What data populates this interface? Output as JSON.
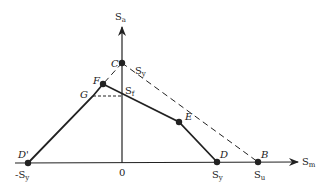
{
  "diagram": {
    "type": "modified goodman / fatigue diagram",
    "axes": {
      "x_label": "S",
      "x_sub": "m",
      "y_label": "S",
      "y_sub": "a",
      "origin_label": "0"
    },
    "points": {
      "C": "C",
      "F": "F",
      "G": "G",
      "E": "E",
      "D": "D",
      "B": "B",
      "Dprime": "D'"
    },
    "tick_labels": {
      "neg_sy": "-S",
      "neg_sy_sub": "y",
      "sy_x": "S",
      "sy_x_sub": "y",
      "su": "S",
      "su_sub": "u",
      "sy_line": "S",
      "sy_line_sub": "y",
      "sf": "S",
      "sf_sub": "f"
    },
    "colors": {
      "ink": "#222222",
      "background": "#ffffff"
    }
  }
}
